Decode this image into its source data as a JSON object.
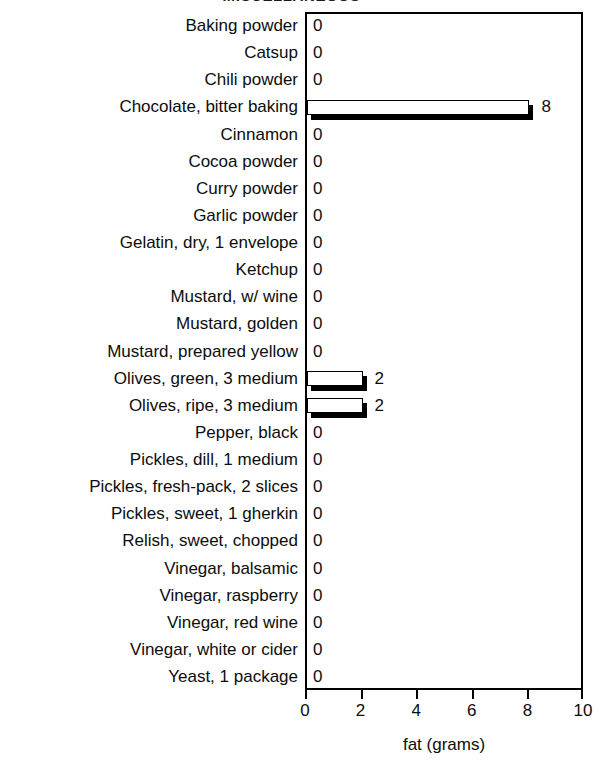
{
  "chart_data": {
    "type": "bar",
    "orientation": "horizontal",
    "title": "MISCELLANEOUS",
    "xlabel": "fat (grams)",
    "ylabel": "",
    "xlim": [
      0,
      10
    ],
    "xticks": [
      0,
      2,
      4,
      6,
      8,
      10
    ],
    "xtick_labels": [
      "0",
      "2",
      "4",
      "6",
      "8",
      "10"
    ],
    "grid": false,
    "legend": false,
    "bar_style": "white-fill-black-outline-with-shadow",
    "categories": [
      "Baking powder",
      "Catsup",
      "Chili powder",
      "Chocolate, bitter baking",
      "Cinnamon",
      "Cocoa powder",
      "Curry powder",
      "Garlic powder",
      "Gelatin, dry, 1 envelope",
      "Ketchup",
      "Mustard, w/ wine",
      "Mustard, golden",
      "Mustard, prepared yellow",
      "Olives, green, 3 medium",
      "Olives, ripe, 3 medium",
      "Pepper, black",
      "Pickles, dill, 1 medium",
      "Pickles, fresh-pack, 2 slices",
      "Pickles, sweet, 1 gherkin",
      "Relish, sweet, chopped",
      "Vinegar, balsamic",
      "Vinegar, raspberry",
      "Vinegar, red wine",
      "Vinegar, white or cider",
      "Yeast, 1 package"
    ],
    "values": [
      0,
      0,
      0,
      8,
      0,
      0,
      0,
      0,
      0,
      0,
      0,
      0,
      0,
      2,
      2,
      0,
      0,
      0,
      0,
      0,
      0,
      0,
      0,
      0,
      0
    ],
    "value_labels": [
      "0",
      "0",
      "0",
      "8",
      "0",
      "0",
      "0",
      "0",
      "0",
      "0",
      "0",
      "0",
      "0",
      "2",
      "2",
      "0",
      "0",
      "0",
      "0",
      "0",
      "0",
      "0",
      "0",
      "0",
      "0"
    ],
    "colors": {
      "bar_fill": "#ffffff",
      "bar_outline": "#000000",
      "bar_shadow": "#000000",
      "text": "#0d0d0d",
      "axis": "#000000",
      "background": "#ffffff"
    }
  }
}
